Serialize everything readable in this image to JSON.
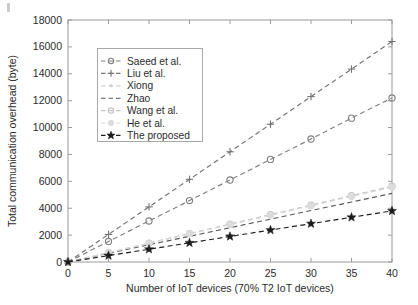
{
  "chart_data": {
    "type": "line",
    "title": "",
    "xlabel": "Number of IoT devices (70% T2 IoT devices)",
    "ylabel": "Total communication overhead (byte)",
    "xlim": [
      0,
      40
    ],
    "ylim": [
      0,
      18000
    ],
    "xticks": [
      0,
      5,
      10,
      15,
      20,
      25,
      30,
      35,
      40
    ],
    "yticks": [
      0,
      2000,
      4000,
      6000,
      8000,
      10000,
      12000,
      14000,
      16000,
      18000
    ],
    "xtick_labels": [
      "0",
      "5",
      "10",
      "15",
      "20",
      "25",
      "30",
      "35",
      "40"
    ],
    "ytick_labels": [
      "0",
      "2000",
      "4000",
      "6000",
      "8000",
      "10000",
      "12000",
      "14000",
      "16000",
      "18000"
    ],
    "grid": false,
    "legend_position": "upper-left-inset",
    "x": [
      0,
      5,
      10,
      15,
      20,
      25,
      30,
      35,
      40
    ],
    "series": [
      {
        "name": "Saeed et al.",
        "values": [
          0,
          1530,
          3050,
          4570,
          6100,
          7630,
          9150,
          10700,
          12200
        ],
        "color": "#808080",
        "marker": "circle",
        "linestyle": "dashed"
      },
      {
        "name": "Liu et al.",
        "values": [
          0,
          2050,
          4100,
          6150,
          8200,
          10250,
          12300,
          14350,
          16400
        ],
        "color": "#737373",
        "marker": "plus",
        "linestyle": "dashed"
      },
      {
        "name": "Xiong",
        "values": [
          0,
          700,
          1400,
          2100,
          2800,
          3500,
          4200,
          4900,
          5600
        ],
        "color": "#d2d2d2",
        "marker": "dot",
        "linestyle": "dashed"
      },
      {
        "name": "Zhao",
        "values": [
          0,
          640,
          1280,
          1910,
          2550,
          3190,
          3830,
          4460,
          5100
        ],
        "color": "#5a5a5a",
        "marker": "none",
        "linestyle": "dashed"
      },
      {
        "name": "Wang et al.",
        "values": [
          0,
          705,
          1410,
          2115,
          2820,
          3525,
          4230,
          4935,
          5640
        ],
        "color": "#c4c4c4",
        "marker": "circle",
        "linestyle": "dashed"
      },
      {
        "name": "He et al.",
        "values": [
          0,
          695,
          1390,
          2085,
          2780,
          3475,
          4170,
          4865,
          5560
        ],
        "color": "#dcdcdc",
        "marker": "circle-filled",
        "linestyle": "dashed"
      },
      {
        "name": "The proposed",
        "values": [
          0,
          475,
          950,
          1425,
          1900,
          2375,
          2850,
          3325,
          3800
        ],
        "color": "#1c1c1c",
        "marker": "star",
        "linestyle": "dashed"
      }
    ]
  },
  "figure": {
    "background": "#ffffff",
    "axis_color": "#9a9a9a",
    "text_color": "#2b2b2b"
  }
}
